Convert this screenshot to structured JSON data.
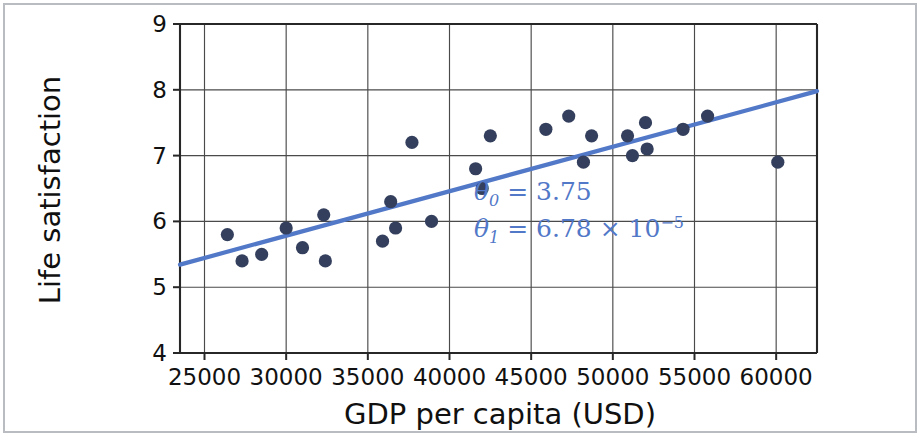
{
  "chart_data": {
    "type": "scatter",
    "title": "",
    "xlabel": "GDP per capita (USD)",
    "ylabel": "Life satisfaction",
    "xlim": [
      23500,
      62500
    ],
    "ylim": [
      4,
      9
    ],
    "xticks": [
      25000,
      30000,
      35000,
      40000,
      45000,
      50000,
      55000,
      60000
    ],
    "yticks": [
      4,
      5,
      6,
      7,
      8,
      9
    ],
    "xtick_labels": [
      "25000",
      "30000",
      "35000",
      "40000",
      "45000",
      "50000",
      "55000",
      "60000"
    ],
    "ytick_labels": [
      "4",
      "5",
      "6",
      "7",
      "8",
      "9"
    ],
    "grid": true,
    "legend": false,
    "series": [
      {
        "name": "Countries",
        "type": "scatter",
        "marker_color": "#333f5c",
        "points": [
          {
            "x": 26400,
            "y": 5.8
          },
          {
            "x": 27300,
            "y": 5.4
          },
          {
            "x": 28500,
            "y": 5.5
          },
          {
            "x": 30000,
            "y": 5.9
          },
          {
            "x": 31000,
            "y": 5.6
          },
          {
            "x": 32300,
            "y": 6.1
          },
          {
            "x": 32400,
            "y": 5.4
          },
          {
            "x": 35900,
            "y": 5.7
          },
          {
            "x": 36400,
            "y": 6.3
          },
          {
            "x": 36700,
            "y": 5.9
          },
          {
            "x": 37700,
            "y": 7.2
          },
          {
            "x": 38900,
            "y": 6.0
          },
          {
            "x": 41600,
            "y": 6.8
          },
          {
            "x": 42000,
            "y": 6.5
          },
          {
            "x": 42500,
            "y": 7.3
          },
          {
            "x": 45900,
            "y": 7.4
          },
          {
            "x": 47300,
            "y": 7.6
          },
          {
            "x": 48200,
            "y": 6.9
          },
          {
            "x": 48700,
            "y": 7.3
          },
          {
            "x": 50900,
            "y": 7.3
          },
          {
            "x": 51200,
            "y": 7.0
          },
          {
            "x": 52000,
            "y": 7.5
          },
          {
            "x": 52100,
            "y": 7.1
          },
          {
            "x": 54300,
            "y": 7.4
          },
          {
            "x": 55800,
            "y": 7.6
          },
          {
            "x": 60100,
            "y": 6.9
          }
        ]
      },
      {
        "name": "Linear model",
        "type": "line",
        "line_color": "#5278c8",
        "theta0": 3.75,
        "theta1": 6.78e-05,
        "equation": "y = 3.75 + 6.78e-05 * x",
        "x_start": 23500,
        "x_end": 62500,
        "y_start": 5.343,
        "y_end": 7.98
      }
    ],
    "annotations": [
      {
        "id": "theta0",
        "symbol": "θ",
        "subscript": "0",
        "operator": "=",
        "value": "3.75",
        "full_text": "θ0 = 3.75",
        "color": "#5278c8",
        "x": 41500,
        "y": 6.32
      },
      {
        "id": "theta1",
        "symbol": "θ",
        "subscript": "1",
        "operator": "=",
        "value": "6.78",
        "times": "×",
        "base": "10",
        "exponent": "−5",
        "full_text": "θ1 = 6.78 × 10−5",
        "color": "#5278c8",
        "x": 41500,
        "y": 5.77
      }
    ]
  }
}
